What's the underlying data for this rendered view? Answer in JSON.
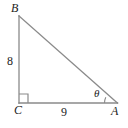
{
  "figure": {
    "kind": "right-triangle-diagram",
    "stroke_color": "#8a8a8a",
    "text_color": "#1c1c1c",
    "background_color": "#ffffff",
    "vertices": [
      {
        "id": "B",
        "label": "B",
        "x": 19,
        "y": 16
      },
      {
        "id": "C",
        "label": "C",
        "x": 19,
        "y": 103
      },
      {
        "id": "A",
        "label": "A",
        "x": 117,
        "y": 103
      }
    ],
    "sides": [
      {
        "id": "BC",
        "label": "8",
        "from": "B",
        "to": "C",
        "orientation": "vertical"
      },
      {
        "id": "CA",
        "label": "9",
        "from": "C",
        "to": "A",
        "orientation": "horizontal"
      },
      {
        "id": "AB",
        "label": "",
        "from": "A",
        "to": "B",
        "orientation": "hypotenuse"
      }
    ],
    "angles": [
      {
        "id": "theta",
        "label": "θ",
        "at_vertex": "A",
        "marker": "arc"
      },
      {
        "id": "right-angle",
        "label": "",
        "at_vertex": "C",
        "marker": "square"
      }
    ],
    "right_angle_square": {
      "x": 19,
      "y": 94,
      "size": 9
    },
    "theta_arc_radius": 13
  }
}
